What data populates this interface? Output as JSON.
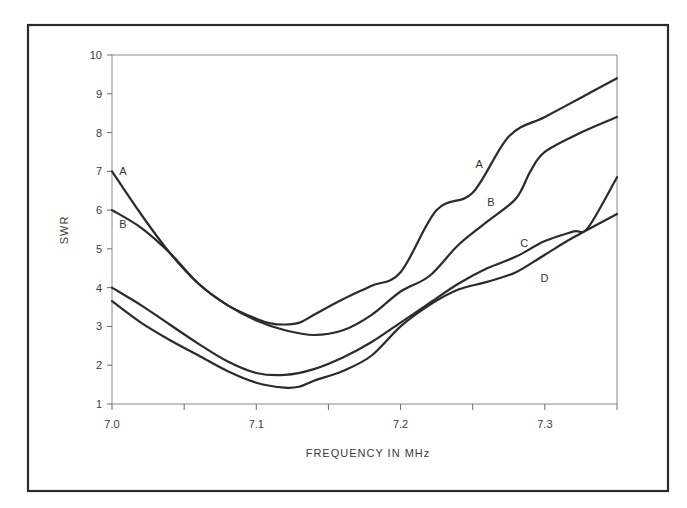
{
  "chart_data": {
    "type": "line",
    "title": "",
    "xlabel": "FREQUENCY IN MHz",
    "ylabel": "SWR",
    "xlim": [
      7.0,
      7.35
    ],
    "ylim": [
      1,
      10
    ],
    "xticks": [
      7.0,
      7.05,
      7.1,
      7.15,
      7.2,
      7.25,
      7.3,
      7.35
    ],
    "xtick_labels": [
      "7.0",
      "",
      "7.1",
      "",
      "7.2",
      "",
      "7.3",
      ""
    ],
    "yticks": [
      1,
      2,
      3,
      4,
      5,
      6,
      7,
      8,
      9,
      10
    ],
    "ytick_labels": [
      "1",
      "2",
      "3",
      "4",
      "5",
      "6",
      "7",
      "8",
      "9",
      "10"
    ],
    "grid": false,
    "legend": "inline curve labels",
    "series": [
      {
        "name": "A",
        "x": [
          7.0,
          7.02,
          7.04,
          7.06,
          7.08,
          7.1,
          7.11,
          7.12,
          7.13,
          7.14,
          7.16,
          7.18,
          7.2,
          7.225,
          7.25,
          7.275,
          7.3,
          7.325,
          7.35
        ],
        "y": [
          7.0,
          5.9,
          4.9,
          4.1,
          3.55,
          3.2,
          3.08,
          3.05,
          3.1,
          3.3,
          3.7,
          4.05,
          4.4,
          6.0,
          6.45,
          7.9,
          8.4,
          8.9,
          9.4
        ],
        "labels": [
          {
            "text": "A",
            "x": 7.005,
            "y": 7.0
          },
          {
            "text": "A",
            "x": 7.252,
            "y": 7.2
          }
        ]
      },
      {
        "name": "B",
        "x": [
          7.0,
          7.02,
          7.04,
          7.06,
          7.08,
          7.1,
          7.12,
          7.14,
          7.16,
          7.18,
          7.2,
          7.22,
          7.24,
          7.26,
          7.28,
          7.29,
          7.3,
          7.325,
          7.35
        ],
        "y": [
          6.0,
          5.55,
          4.9,
          4.1,
          3.55,
          3.15,
          2.9,
          2.78,
          2.9,
          3.3,
          3.9,
          4.3,
          5.1,
          5.7,
          6.3,
          7.0,
          7.5,
          8.0,
          8.4
        ],
        "labels": [
          {
            "text": "B",
            "x": 7.005,
            "y": 5.65
          },
          {
            "text": "B",
            "x": 7.26,
            "y": 6.2
          }
        ]
      },
      {
        "name": "C",
        "x": [
          7.0,
          7.02,
          7.04,
          7.06,
          7.08,
          7.1,
          7.12,
          7.14,
          7.16,
          7.18,
          7.2,
          7.22,
          7.24,
          7.26,
          7.28,
          7.3,
          7.32,
          7.33,
          7.35
        ],
        "y": [
          4.0,
          3.55,
          3.05,
          2.55,
          2.1,
          1.8,
          1.75,
          1.9,
          2.2,
          2.6,
          3.1,
          3.6,
          4.1,
          4.5,
          4.8,
          5.2,
          5.45,
          5.55,
          6.85
        ],
        "labels": [
          {
            "text": "C",
            "x": 7.283,
            "y": 5.15
          }
        ]
      },
      {
        "name": "D",
        "x": [
          7.0,
          7.02,
          7.04,
          7.06,
          7.08,
          7.1,
          7.12,
          7.13,
          7.14,
          7.16,
          7.18,
          7.2,
          7.22,
          7.24,
          7.26,
          7.28,
          7.3,
          7.32,
          7.35
        ],
        "y": [
          3.65,
          3.1,
          2.65,
          2.25,
          1.85,
          1.55,
          1.42,
          1.45,
          1.6,
          1.85,
          2.25,
          3.0,
          3.55,
          3.95,
          4.15,
          4.4,
          4.85,
          5.3,
          5.9
        ],
        "labels": [
          {
            "text": "D",
            "x": 7.297,
            "y": 4.25
          }
        ]
      }
    ]
  }
}
